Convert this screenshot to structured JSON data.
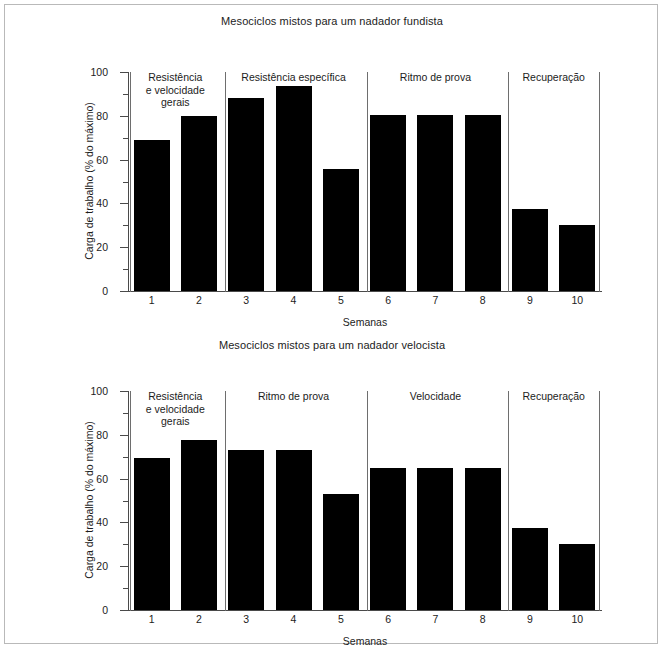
{
  "chart_data": [
    {
      "type": "bar",
      "title": "Mesociclos mistos para um nadador fundista",
      "xlabel": "Semanas",
      "ylabel": "Carga de trabalho (% do máximo)",
      "categories": [
        "1",
        "2",
        "3",
        "4",
        "5",
        "6",
        "7",
        "8",
        "9",
        "10"
      ],
      "values": [
        69,
        80,
        88,
        93.5,
        55.5,
        80.5,
        80.5,
        80.5,
        37.5,
        30
      ],
      "ylim": [
        0,
        100
      ],
      "yticks": [
        0,
        20,
        40,
        60,
        80,
        100
      ],
      "ytick_labels": [
        "0",
        "20",
        "40",
        "60",
        "80",
        "100"
      ],
      "yminor_ticks": [
        10,
        30,
        50,
        70,
        90
      ],
      "grid": false,
      "legend": "none",
      "bar_color": "#000000",
      "phases": [
        {
          "label": "Resistência\ne velocidade\ngerais",
          "weeks": [
            "1",
            "2"
          ]
        },
        {
          "label": "Resistência específica",
          "weeks": [
            "3",
            "4",
            "5"
          ]
        },
        {
          "label": "Ritmo de prova",
          "weeks": [
            "6",
            "7",
            "8"
          ]
        },
        {
          "label": "Recuperação",
          "weeks": [
            "9",
            "10"
          ]
        }
      ]
    },
    {
      "type": "bar",
      "title": "Mesociclos mistos para um nadador velocista",
      "xlabel": "Semanas",
      "ylabel": "Carga de trabalho (% do máximo)",
      "categories": [
        "1",
        "2",
        "3",
        "4",
        "5",
        "6",
        "7",
        "8",
        "9",
        "10"
      ],
      "values": [
        69.5,
        77.5,
        73,
        73,
        53,
        65,
        65,
        65,
        37.5,
        30
      ],
      "ylim": [
        0,
        100
      ],
      "yticks": [
        0,
        20,
        40,
        60,
        80,
        100
      ],
      "ytick_labels": [
        "0",
        "20",
        "40",
        "60",
        "80",
        "100"
      ],
      "yminor_ticks": [
        10,
        30,
        50,
        70,
        90
      ],
      "grid": false,
      "legend": "none",
      "bar_color": "#000000",
      "phases": [
        {
          "label": "Resistência\ne velocidade\ngerais",
          "weeks": [
            "1",
            "2"
          ]
        },
        {
          "label": "Ritmo de prova",
          "weeks": [
            "3",
            "4",
            "5"
          ]
        },
        {
          "label": "Velocidade",
          "weeks": [
            "6",
            "7",
            "8"
          ]
        },
        {
          "label": "Recuperação",
          "weeks": [
            "9",
            "10"
          ]
        }
      ]
    }
  ],
  "figures": [
    {
      "title": "Mesociclos mistos para um nadador fundista",
      "x_axis_title": "Semanas",
      "y_axis_title": "Carga de trabalho (% do máximo)"
    },
    {
      "title": "Mesociclos mistos para um nadador velocista",
      "x_axis_title": "Semanas",
      "y_axis_title": "Carga de trabalho (% do máximo)"
    }
  ],
  "colors": {
    "bar": "#000000",
    "axis": "#4a4a4a",
    "divider": "#6e6e6e",
    "page_border": "#b9b9b9",
    "text": "#1c1c1c",
    "background": "#ffffff"
  }
}
